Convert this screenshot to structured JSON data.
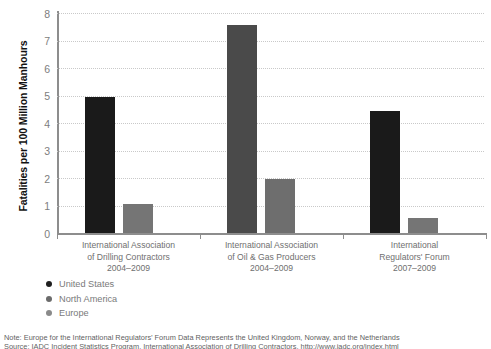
{
  "chart_data": {
    "type": "bar",
    "title": "",
    "xlabel": "",
    "ylabel": "Fatalities per 100 Million Manhours",
    "ylim": [
      0,
      8
    ],
    "yticks": [
      0,
      1,
      2,
      3,
      4,
      5,
      6,
      7,
      8
    ],
    "grid": true,
    "legend_position": "below-left",
    "categories": [
      "International Association of Drilling Contractors 2004–2009",
      "International Association of Oil & Gas Producers 2004–2009",
      "International Regulators' Forum 2007–2009"
    ],
    "category_lines": [
      [
        "International Association",
        "of Drilling Contractors",
        "2004–2009"
      ],
      [
        "International Association",
        "of Oil & Gas Producers",
        "2004–2009"
      ],
      [
        "International",
        "Regulators' Forum",
        "2007–2009"
      ]
    ],
    "series": [
      {
        "name": "United States",
        "color": "#1a1a1a",
        "values": [
          4.95,
          null,
          4.45
        ]
      },
      {
        "name": "North America",
        "color": "#4a4a4a",
        "values": [
          null,
          7.55,
          null
        ]
      },
      {
        "name": "Europe",
        "color": "#757575",
        "values": [
          1.05,
          1.95,
          0.55
        ]
      }
    ],
    "bars": [
      {
        "group": 0,
        "series": "United States",
        "value": 4.95,
        "color": "#1a1a1a"
      },
      {
        "group": 0,
        "series": "Europe",
        "value": 1.05,
        "color": "#757575"
      },
      {
        "group": 1,
        "series": "North America",
        "value": 7.55,
        "color": "#4a4a4a"
      },
      {
        "group": 1,
        "series": "Europe",
        "value": 1.95,
        "color": "#6e6e6e"
      },
      {
        "group": 2,
        "series": "United States",
        "value": 4.45,
        "color": "#1a1a1a"
      },
      {
        "group": 2,
        "series": "Europe",
        "value": 0.55,
        "color": "#757575"
      }
    ]
  },
  "axis": {
    "y_title": "Fatalities per 100 Million Manhours",
    "tick_8": "8",
    "tick_7": "7",
    "tick_6": "6",
    "tick_5": "5",
    "tick_4": "4",
    "tick_3": "3",
    "tick_2": "2",
    "tick_1": "1",
    "tick_0": "0"
  },
  "groups": [
    {
      "line1": "International Association",
      "line2": "of Drilling Contractors",
      "line3": "2004–2009"
    },
    {
      "line1": "International Association",
      "line2": "of Oil & Gas Producers",
      "line3": "2004–2009"
    },
    {
      "line1": "International",
      "line2": "Regulators' Forum",
      "line3": "2007–2009"
    }
  ],
  "legend": {
    "items": [
      {
        "label": "United States",
        "color": "#1f1f1f"
      },
      {
        "label": "North America",
        "color": "#6b6b6b"
      },
      {
        "label": "Europe",
        "color": "#8a8a8a"
      }
    ]
  },
  "notes": {
    "note": "Note: Europe for the International Regulators’ Forum Data Represents the United Kingdom, Norway, and the Netherlands",
    "source": "Source: IADC Incident Statistics Program, International Association of Drilling Contractors, http://www.iadc.org/index.html"
  }
}
